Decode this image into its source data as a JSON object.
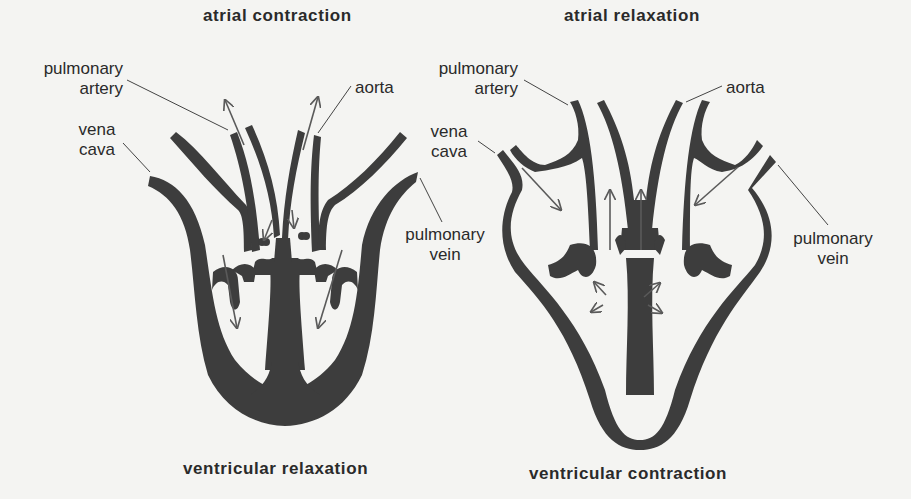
{
  "diagram": {
    "colors": {
      "background": "#f4f4f2",
      "tissue": "#3d3d3d",
      "arrow": "#5a5a5a",
      "text": "#2a2a2a"
    },
    "left_panel": {
      "top_title": "atrial contraction",
      "bottom_title": "ventricular relaxation",
      "labels": {
        "pulmonary_artery_1": "pulmonary",
        "pulmonary_artery_2": "artery",
        "aorta": "aorta",
        "vena_cava_1": "vena",
        "vena_cava_2": "cava",
        "pulmonary_vein_1": "pulmonary",
        "pulmonary_vein_2": "vein"
      }
    },
    "right_panel": {
      "top_title": "atrial relaxation",
      "bottom_title": "ventricular contraction",
      "labels": {
        "pulmonary_artery_1": "pulmonary",
        "pulmonary_artery_2": "artery",
        "aorta": "aorta",
        "vena_cava_1": "vena",
        "vena_cava_2": "cava",
        "pulmonary_vein_1": "pulmonary",
        "pulmonary_vein_2": "vein"
      }
    }
  }
}
